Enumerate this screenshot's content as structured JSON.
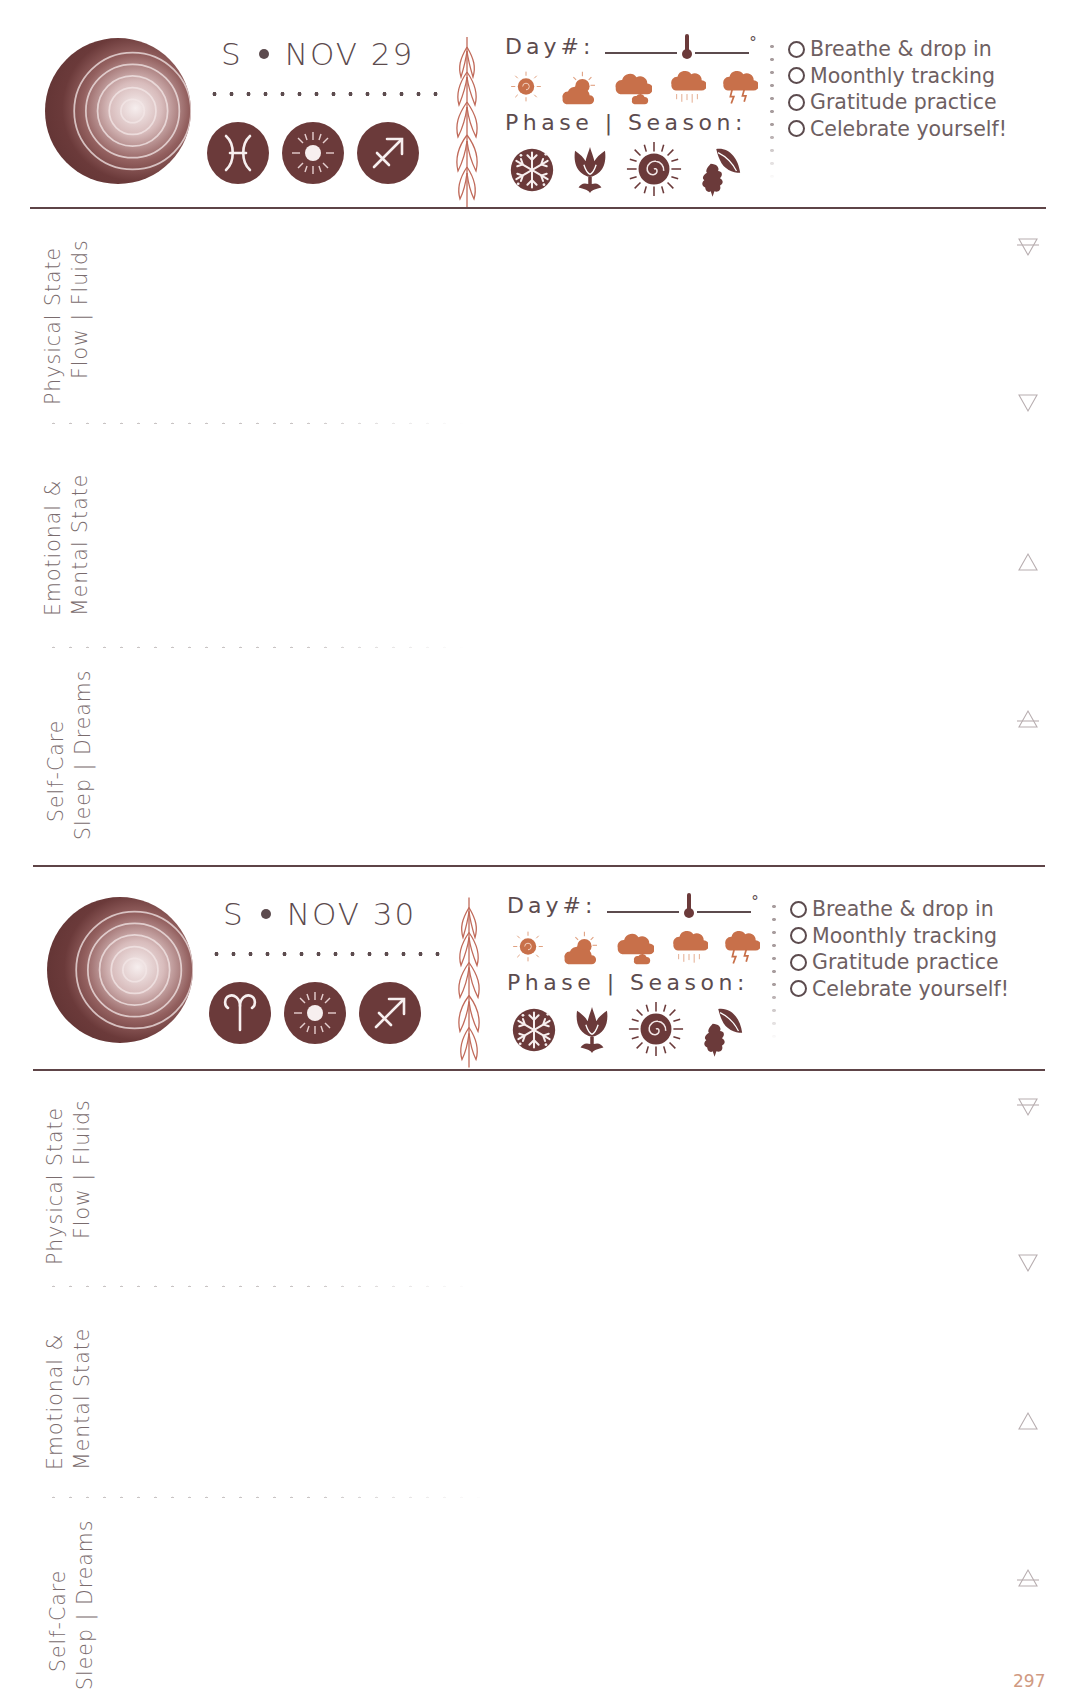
{
  "colors": {
    "dark_brown": "#6b3a3a",
    "text_brown": "#5c4b4e",
    "weather_orange": "#c8704a",
    "sprig_red": "#c06a5a",
    "dotted_grey": "#c9c4c4",
    "page_number": "#d09a82"
  },
  "days": [
    {
      "weekday_initial": "S",
      "date": "NOV 29",
      "moon_icon": "waning-crescent-moon-icon",
      "zodiac_icons": [
        {
          "name": "pisces-icon",
          "glyph": "♓"
        },
        {
          "name": "sun-icon",
          "glyph": "☼"
        },
        {
          "name": "sagittarius-icon",
          "glyph": "♐"
        }
      ],
      "day_label": "Day#:",
      "degree_symbol": "°",
      "weather_icons": [
        "sunny-icon",
        "partly-cloudy-icon",
        "cloudy-icon",
        "rain-icon",
        "storm-icon"
      ],
      "phase_label": "Phase | Season:",
      "season_icons": [
        "winter-snowflake-icon",
        "spring-tulip-icon",
        "summer-sun-icon",
        "autumn-leaves-icon"
      ],
      "checklist": [
        "Breathe & drop in",
        "Moonthly tracking",
        "Gratitude practice",
        "Celebrate yourself!"
      ],
      "sections": [
        {
          "line1": "Physical State",
          "line2": "Flow | Fluids",
          "element": "earth-symbol-icon"
        },
        {
          "line1": "Emotional &",
          "line2": "Mental State",
          "element": "water-symbol-icon"
        },
        {
          "line1": "Self-Care",
          "line2": "Sleep | Dreams",
          "element": "fire-symbol-icon"
        }
      ]
    },
    {
      "weekday_initial": "S",
      "date": "NOV 30",
      "moon_icon": "waning-crescent-moon-icon",
      "zodiac_icons": [
        {
          "name": "aries-icon",
          "glyph": "♈"
        },
        {
          "name": "sun-icon",
          "glyph": "☼"
        },
        {
          "name": "sagittarius-icon",
          "glyph": "♐"
        }
      ],
      "day_label": "Day#:",
      "degree_symbol": "°",
      "weather_icons": [
        "sunny-icon",
        "partly-cloudy-icon",
        "cloudy-icon",
        "rain-icon",
        "storm-icon"
      ],
      "phase_label": "Phase | Season:",
      "season_icons": [
        "winter-snowflake-icon",
        "spring-tulip-icon",
        "summer-sun-icon",
        "autumn-leaves-icon"
      ],
      "checklist": [
        "Breathe & drop in",
        "Moonthly tracking",
        "Gratitude practice",
        "Celebrate yourself!"
      ],
      "sections": [
        {
          "line1": "Physical State",
          "line2": "Flow | Fluids",
          "element": "earth-symbol-icon"
        },
        {
          "line1": "Emotional &",
          "line2": "Mental State",
          "element": "water-symbol-icon"
        },
        {
          "line1": "Self-Care",
          "line2": "Sleep | Dreams",
          "element": "fire-symbol-icon"
        }
      ]
    }
  ],
  "element_symbols_right": [
    "earth-symbol-icon",
    "water-symbol-icon",
    "fire-symbol-icon",
    "air-symbol-icon"
  ],
  "page_number": "297"
}
